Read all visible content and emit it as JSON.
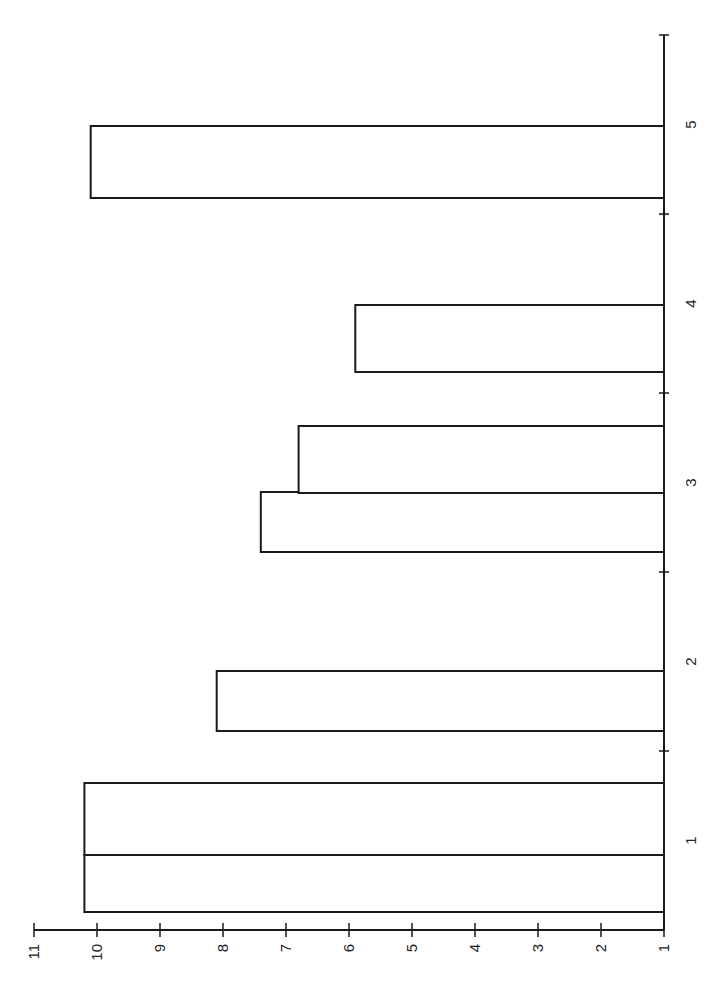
{
  "chart_data": {
    "type": "bar",
    "orientation_note": "vertical bar chart rendered rotated 90 degrees counter-clockwise",
    "title": "",
    "xlabel": "",
    "ylabel": "",
    "categories": [
      "1",
      "2",
      "3",
      "4",
      "5"
    ],
    "bars": [
      {
        "category": "1",
        "values": [
          10.2,
          10.2
        ]
      },
      {
        "category": "2",
        "values": [
          8.1
        ]
      },
      {
        "category": "3",
        "values": [
          7.4,
          6.8
        ]
      },
      {
        "category": "4",
        "values": [
          5.9
        ]
      },
      {
        "category": "5",
        "values": [
          10.1
        ]
      }
    ],
    "ylim": [
      1,
      11
    ],
    "yticks": [
      "1",
      "2",
      "3",
      "4",
      "5",
      "6",
      "7",
      "8",
      "9",
      "10",
      "11"
    ],
    "grid": false,
    "legend": null,
    "colors": {
      "bar_fill": "#ffffff",
      "bar_stroke": "#1a1a1a",
      "axis": "#1a1a1a"
    }
  }
}
